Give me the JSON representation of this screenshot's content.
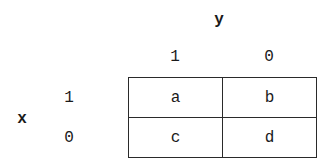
{
  "diagram": {
    "type": "2x2 contingency table",
    "column_variable": "y",
    "row_variable": "x",
    "column_headers": [
      "1",
      "0"
    ],
    "row_headers": [
      "1",
      "0"
    ],
    "cells": [
      [
        "a",
        "b"
      ],
      [
        "c",
        "d"
      ]
    ]
  }
}
